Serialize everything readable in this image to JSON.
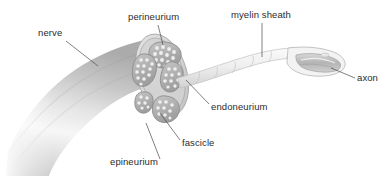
{
  "diagram": {
    "background_color": "#ffffff",
    "width": 392,
    "height": 178
  },
  "labels": [
    {
      "id": "nerve",
      "text": "nerve",
      "x": 38,
      "y": 36,
      "anchor": "start"
    },
    {
      "id": "perineurium",
      "text": "perineurium",
      "x": 128,
      "y": 20,
      "anchor": "start"
    },
    {
      "id": "myelin_sheath",
      "text": "myelin sheath",
      "x": 231,
      "y": 18,
      "anchor": "start"
    },
    {
      "id": "axon",
      "text": "axon",
      "x": 357,
      "y": 81,
      "anchor": "start"
    },
    {
      "id": "endoneurium",
      "text": "endoneurium",
      "x": 211,
      "y": 110,
      "anchor": "start"
    },
    {
      "id": "fascicle",
      "text": "fascicle",
      "x": 182,
      "y": 146,
      "anchor": "start"
    },
    {
      "id": "epineurium",
      "text": "epineurium",
      "x": 110,
      "y": 165,
      "anchor": "start"
    }
  ],
  "colors": {
    "label_text": "#2b2b2b",
    "leader_line": "#4a4a4a",
    "nerve_body_light": "#f2f2f2",
    "nerve_body_mid": "#c9c9c9",
    "nerve_body_shadow": "#a8a8a8",
    "fascicle_fill": "#b6b6b6",
    "fascicle_outline": "#8f8f8f",
    "axon_dot": "#ededed",
    "epineurium_face": "#dcdcdc",
    "myelin_fill": "#f4f4f4",
    "myelin_outline": "#bdbdbd",
    "axon_core": "#c2c2c2"
  },
  "structures": {
    "nerve_trunk": "cut cylindrical nerve trunk, curving from lower-left to upper-right",
    "cross_section": "elliptical cut face showing 5 fascicles",
    "fascicle_count": 5,
    "nerve_fiber": "single myelinated fiber emerging from cross-section toward upper right",
    "node_segments": 6,
    "cut_away_end": "distal fiber sectioned to expose internal axon"
  }
}
